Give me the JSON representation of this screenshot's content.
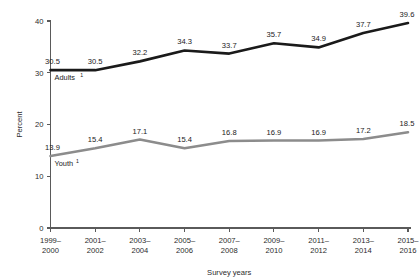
{
  "chart_data": {
    "type": "line",
    "title": "",
    "xlabel": "Survey years",
    "ylabel": "Percent",
    "categories": [
      "1999–2000",
      "2001–2002",
      "2003–2004",
      "2005–2006",
      "2007–2008",
      "2009–2010",
      "2011–2012",
      "2013–2014",
      "2015–2016"
    ],
    "category_lines": [
      [
        "1999–",
        "2000"
      ],
      [
        "2001–",
        "2002"
      ],
      [
        "2003–",
        "2004"
      ],
      [
        "2005–",
        "2006"
      ],
      [
        "2007–",
        "2008"
      ],
      [
        "2009–",
        "2010"
      ],
      [
        "2011–",
        "2012"
      ],
      [
        "2013–",
        "2014"
      ],
      [
        "2015–",
        "2016"
      ]
    ],
    "series": [
      {
        "name": "Adults",
        "footnote_marker": "1",
        "color": "#1a1a1a",
        "stroke_width": 2.6,
        "label_offset_y": -6,
        "inline_label_x_index": 0,
        "values": [
          30.5,
          30.5,
          32.2,
          34.3,
          33.7,
          35.7,
          34.9,
          37.7,
          39.6
        ],
        "value_labels": [
          "30.5",
          "30.5",
          "32.2",
          "34.3",
          "33.7",
          "35.7",
          "34.9",
          "37.7",
          "39.6"
        ]
      },
      {
        "name": "Youth",
        "footnote_marker": "1",
        "color": "#8c8c8c",
        "stroke_width": 2.6,
        "label_offset_y": -6,
        "inline_label_x_index": 0,
        "values": [
          13.9,
          15.4,
          17.1,
          15.4,
          16.8,
          16.9,
          16.9,
          17.2,
          18.5
        ],
        "value_labels": [
          "13.9",
          "15.4",
          "17.1",
          "15.4",
          "16.8",
          "16.9",
          "16.9",
          "17.2",
          "18.5"
        ]
      }
    ],
    "ylim": [
      0,
      40
    ],
    "yticks": [
      0,
      10,
      20,
      30,
      40
    ],
    "ytick_labels": [
      "0",
      "10",
      "20",
      "30",
      "40"
    ],
    "grid": false,
    "legend_position": "inline"
  }
}
